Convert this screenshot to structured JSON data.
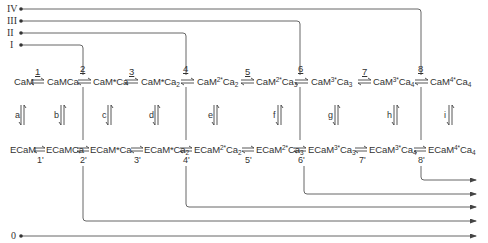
{
  "inputs": [
    {
      "label": "IV",
      "y": 9
    },
    {
      "label": "III",
      "y": 21
    },
    {
      "label": "II",
      "y": 33
    },
    {
      "label": "I",
      "y": 45
    },
    {
      "label": "0",
      "y": 236
    }
  ],
  "top_row": {
    "species": [
      {
        "base": "CaM",
        "sup": "",
        "sub": ""
      },
      {
        "base": "CaMCa",
        "sup": "",
        "sub": ""
      },
      {
        "base": "CaM*Ca",
        "sup": "",
        "sub": ""
      },
      {
        "base": "CaM*Ca",
        "sup": "",
        "sub": "2"
      },
      {
        "base": "CaM",
        "sup": "2*",
        "mid": "Ca",
        "sub": "2"
      },
      {
        "base": "CaM",
        "sup": "2*",
        "mid": "Ca",
        "sub": "3"
      },
      {
        "base": "CaM",
        "sup": "3*",
        "mid": "Ca",
        "sub": "3"
      },
      {
        "base": "CaM",
        "sup": "3*",
        "mid": "Ca",
        "sub": "4"
      },
      {
        "base": "CaM",
        "sup": "4*",
        "mid": "Ca",
        "sub": "4"
      }
    ],
    "reactions": [
      "1",
      "2",
      "3",
      "4",
      "5",
      "6",
      "7",
      "8"
    ]
  },
  "bottom_row": {
    "species": [
      {
        "base": "ECaM",
        "sup": "",
        "sub": ""
      },
      {
        "base": "ECaMCa",
        "sup": "",
        "sub": ""
      },
      {
        "base": "ECaM*Ca",
        "sup": "",
        "sub": ""
      },
      {
        "base": "ECaM*Ca",
        "sup": "",
        "sub": "2"
      },
      {
        "base": "ECaM",
        "sup": "2*",
        "mid": "Ca",
        "sub": "2"
      },
      {
        "base": "ECaM",
        "sup": "2*",
        "mid": "Ca",
        "sub": "3"
      },
      {
        "base": "ECaM",
        "sup": "3*",
        "mid": "Ca",
        "sub": "3"
      },
      {
        "base": "ECaM",
        "sup": "3*",
        "mid": "Ca",
        "sub": "4"
      },
      {
        "base": "ECaM",
        "sup": "4*",
        "mid": "Ca",
        "sub": "4"
      }
    ],
    "reactions": [
      "1'",
      "2'",
      "3'",
      "4'",
      "5'",
      "6'",
      "7'",
      "8'"
    ]
  },
  "vertical_reactions": [
    "a",
    "b",
    "c",
    "d",
    "e",
    "f",
    "g",
    "h",
    "i"
  ],
  "connections": {
    "I_enters_at": "2",
    "II_enters_at": "4",
    "III_enters_at": "6",
    "IV_enters_at": "8",
    "outputs_top_to_bottom": [
      "8'",
      "6'",
      "4'",
      "2'",
      "0"
    ]
  },
  "colors": {
    "line": "#555555",
    "text": "#333333",
    "background": "#ffffff"
  }
}
